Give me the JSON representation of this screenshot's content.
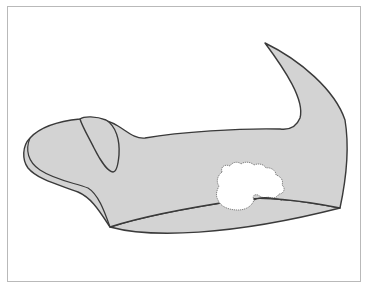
{
  "diagram": {
    "colors": {
      "background": "#ffffff",
      "frame_border": "#b9b9b9",
      "organ_fill": "#d3d3d3",
      "organ_stroke": "#3a3a3a",
      "lesion_fill": "#ffffff",
      "lesion_stroke": "#777777"
    },
    "parts": [
      {
        "id": "organ-body",
        "label": ""
      },
      {
        "id": "tail-horn",
        "label": ""
      },
      {
        "id": "ear-flap",
        "label": ""
      },
      {
        "id": "lower-fold",
        "label": ""
      },
      {
        "id": "lesion",
        "label": ""
      }
    ]
  }
}
